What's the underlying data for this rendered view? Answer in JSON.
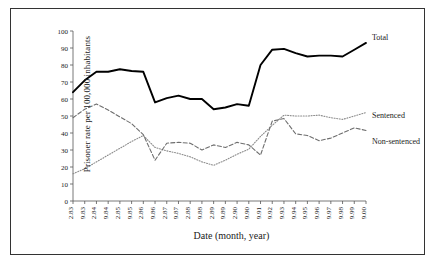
{
  "chart_data": {
    "type": "line",
    "title": "",
    "xlabel": "Date (month, year)",
    "ylabel": "Prisoner rate per 100,000 inhabitants",
    "ylim": [
      0,
      100
    ],
    "ytick_values": [
      0,
      10,
      20,
      30,
      40,
      50,
      60,
      70,
      80,
      90,
      100
    ],
    "grid": false,
    "legend_position": "right-inline",
    "categories": [
      "2.83",
      "9.83",
      "2.84",
      "9.84",
      "2.85",
      "9.85",
      "2.86",
      "9.86",
      "2.87",
      "9.87",
      "2.88",
      "9.88",
      "2.89",
      "9.89",
      "2.90",
      "9.90",
      "9.91",
      "9.92",
      "9.93",
      "9.94",
      "9.95",
      "9.96",
      "9.97",
      "9.98",
      "9.99",
      "9.00"
    ],
    "series": [
      {
        "name": "Total",
        "style": "solid-thick",
        "color": "#000000",
        "values": [
          64,
          71,
          76,
          76,
          77.5,
          76.5,
          76,
          58,
          60.5,
          62,
          60,
          60,
          54,
          55,
          57,
          56,
          80,
          89,
          89.5,
          87,
          85,
          85.5,
          85.5,
          85,
          89,
          93
        ]
      },
      {
        "name": "Sentenced",
        "style": "dotted",
        "color": "#8c8c8c",
        "values": [
          16,
          19,
          23,
          27,
          31,
          35,
          38.5,
          31.5,
          29.5,
          28,
          26,
          23,
          21,
          24,
          27.5,
          30.5,
          38,
          44.5,
          50.5,
          50,
          50,
          50.5,
          49,
          48,
          50,
          52
        ]
      },
      {
        "name": "Non-sentenced",
        "style": "dashed",
        "color": "#6e6e6e",
        "values": [
          49,
          54,
          57,
          53.5,
          49.5,
          45.5,
          39,
          24,
          34,
          34.5,
          34,
          30,
          33,
          31.5,
          34.5,
          33,
          27,
          47,
          48.5,
          39.5,
          38.5,
          35.5,
          37,
          40,
          43,
          41.5
        ]
      }
    ],
    "legend_labels": [
      "Total",
      "Sentenced",
      "Non-sentenced"
    ]
  }
}
